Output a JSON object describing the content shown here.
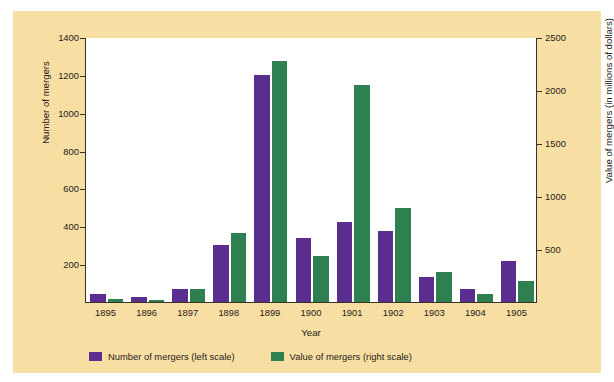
{
  "figure": {
    "background_color": "#f7dfa4",
    "plot_background_color": "#ffffff",
    "frame_color": "#3a3428"
  },
  "legend": {
    "entries": [
      {
        "label": "Number of mergers (left scale)",
        "color": "#5b2d8e",
        "swatch_name": "legend-swatch-number-of-mergers"
      },
      {
        "label": "Value of mergers (right scale)",
        "color": "#2f8050",
        "swatch_name": "legend-swatch-value-of-mergers"
      }
    ]
  },
  "chart_data": {
    "type": "bar",
    "title": "",
    "xlabel": "Year",
    "ylabel": "Number of mergers",
    "ylabel_secondary": "Value of mergers (in millions of dollars)",
    "grid": false,
    "legend_position": "bottom-left",
    "categories": [
      "1895",
      "1896",
      "1897",
      "1898",
      "1899",
      "1900",
      "1901",
      "1902",
      "1903",
      "1904",
      "1905"
    ],
    "ylim": [
      0,
      1400
    ],
    "yticks": [
      0,
      200,
      400,
      600,
      800,
      1000,
      1200,
      1400
    ],
    "ytick_labels": [
      "",
      "200",
      "400",
      "600",
      "800",
      "1000",
      "1200",
      "1400"
    ],
    "ylim_secondary": [
      0,
      2500
    ],
    "yticks_secondary": [
      0,
      500,
      1000,
      1500,
      2000,
      2500
    ],
    "ytick_labels_secondary": [
      "",
      "500",
      "1000",
      "1500",
      "2000",
      "2500"
    ],
    "series": [
      {
        "name": "Number of mergers (left scale)",
        "axis": "left",
        "color": "#5b2d8e",
        "values": [
          43,
          26,
          69,
          303,
          1200,
          340,
          423,
          375,
          130,
          70,
          215
        ]
      },
      {
        "name": "Value of mergers (right scale)",
        "axis": "right",
        "color": "#2f8050",
        "values": [
          30,
          20,
          120,
          650,
          2270,
          430,
          2050,
          890,
          280,
          80,
          200
        ]
      }
    ]
  }
}
